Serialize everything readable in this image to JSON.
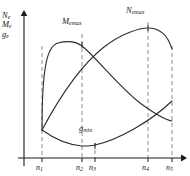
{
  "chart_data": {
    "type": "line",
    "title": "",
    "xlabel": "n",
    "ylabel": "Ne / Me / ge",
    "grid": false,
    "legend_position": "inline-annotations",
    "axis_labels": [
      {
        "base": "N",
        "sub": "e"
      },
      {
        "base": "M",
        "sub": "e"
      },
      {
        "base": "g",
        "sub": "e"
      }
    ],
    "xlim": [
      0,
      190
    ],
    "ylim": [
      0,
      176
    ],
    "x_ticks": [
      {
        "base": "n",
        "sub": "1",
        "x": 42
      },
      {
        "base": "n",
        "sub": "2",
        "x": 82
      },
      {
        "base": "n",
        "sub": "3",
        "x": 95
      },
      {
        "base": "n",
        "sub": "4",
        "x": 148
      },
      {
        "base": "n",
        "sub": "5",
        "x": 172
      }
    ],
    "annotations": [
      {
        "base": "M",
        "sub": "emax",
        "x": 64,
        "y": 20
      },
      {
        "base": "N",
        "sub": "emax",
        "x": 128,
        "y": 8
      },
      {
        "base": "g",
        "sub": "min",
        "x": 78,
        "y": 124
      }
    ],
    "series": [
      {
        "name": "Me",
        "description": "torque curve: rises from left endpoint, peaks at n2, falls to n5",
        "path": "M 42,130 C 42,62 48,46 58,43 C 70,40 78,43 82,46 C 94,55 118,86 140,103 C 155,114 166,120 172,121"
      },
      {
        "name": "Ne",
        "description": "power curve: rises from left endpoint, peaks at n4, drops at n5",
        "path": "M 42,130 C 58,100 80,66 104,47 C 122,33 140,28 148,28 C 160,28 168,36 172,49"
      },
      {
        "name": "ge",
        "description": "specific fuel consumption: falls from left endpoint to minimum near n3, rises to n5",
        "path": "M 42,130 C 56,140 70,145 82,146 C 88,146 92,146 95,145 C 118,140 150,122 172,101"
      }
    ],
    "dashed_guides": [
      {
        "x": 42,
        "y_top": 46,
        "y_bottom": 158
      },
      {
        "x": 82,
        "y_top": 34,
        "y_bottom": 158
      },
      {
        "x": 95,
        "y_top": 143,
        "y_bottom": 158
      },
      {
        "x": 148,
        "y_top": 22,
        "y_bottom": 158
      },
      {
        "x": 172,
        "y_top": 46,
        "y_bottom": 158
      }
    ],
    "axes": {
      "x_axis": {
        "x1": 18,
        "y1": 158,
        "x2": 184,
        "y2": 158
      },
      "y_axis": {
        "x1": 24,
        "y1": 166,
        "x2": 24,
        "y2": 12
      }
    },
    "colors": {
      "curve": "#2b2b2b",
      "axis": "#1a1a1a",
      "dashed": "#8c8c8c",
      "background": "#ffffff"
    }
  }
}
